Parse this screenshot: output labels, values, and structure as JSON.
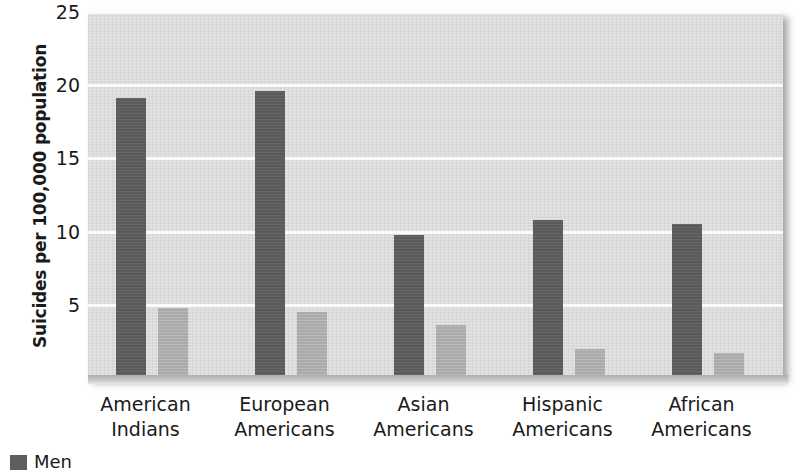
{
  "chart_data": {
    "type": "bar",
    "title": "",
    "xlabel": "",
    "ylabel": "Suicides per 100,000 population",
    "ylim": [
      0,
      25
    ],
    "yticks": [
      5,
      10,
      15,
      20,
      25
    ],
    "grid": true,
    "legend_position": "bottom-left",
    "categories": [
      "American Indians",
      "European Americans",
      "Asian Americans",
      "Hispanic Americans",
      "African Americans"
    ],
    "category_lines": [
      [
        "American",
        "Indians"
      ],
      [
        "European",
        "Americans"
      ],
      [
        "Asian",
        "Americans"
      ],
      [
        "Hispanic",
        "Americans"
      ],
      [
        "African",
        "Americans"
      ]
    ],
    "series": [
      {
        "name": "Men",
        "color": "#5e5e5e",
        "values": [
          19.1,
          19.6,
          9.8,
          10.8,
          10.5
        ]
      },
      {
        "name": "Women",
        "color": "#b0b0b0",
        "values": [
          4.8,
          4.5,
          3.6,
          2.0,
          1.7
        ]
      }
    ]
  },
  "axis": {
    "y_title": "Suicides per 100,000 population",
    "y_tick_labels": [
      "25",
      "20",
      "15",
      "10",
      "5"
    ]
  },
  "legend": {
    "items": [
      {
        "label": "Men",
        "swatch": "men"
      }
    ]
  },
  "colors": {
    "plot_background": "#dcdcdc",
    "gridline": "#fbfbfb",
    "men_bar": "#5e5e5e",
    "women_bar": "#b0b0b0",
    "text": "#1a1a1a"
  }
}
